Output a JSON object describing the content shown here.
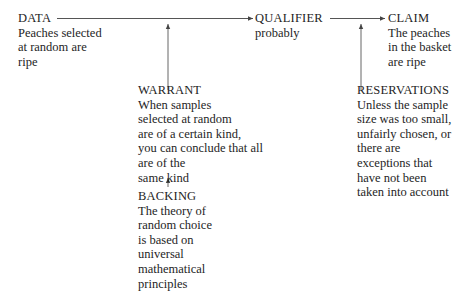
{
  "diagram": {
    "type": "Toulmin argument model",
    "nodes": {
      "data": {
        "title": "DATA",
        "lines": [
          "Peaches selected",
          "at random are",
          "ripe"
        ]
      },
      "qualifier": {
        "title": "QUALIFIER",
        "lines": [
          "probably"
        ]
      },
      "claim": {
        "title": "CLAIM",
        "lines": [
          "The peaches",
          "in the basket",
          "are ripe"
        ]
      },
      "warrant": {
        "title": "WARRANT",
        "lines": [
          "When samples",
          "selected at random",
          "are of a certain kind,",
          "you can conclude that all",
          "are of the",
          "same kind"
        ]
      },
      "backing": {
        "title": "BACKING",
        "lines": [
          "The theory of",
          "random choice",
          "is based on",
          "universal",
          "mathematical",
          "principles"
        ]
      },
      "reservations": {
        "title": "RESERVATIONS",
        "lines": [
          "Unless the sample",
          "size was too small,",
          "unfairly chosen, or",
          "there are",
          "exceptions that",
          "have not been",
          "taken into account"
        ]
      }
    },
    "edges": [
      {
        "from": "DATA",
        "to": "QUALIFIER"
      },
      {
        "from": "QUALIFIER",
        "to": "CLAIM"
      },
      {
        "from": "WARRANT",
        "to": "DATA-QUALIFIER link"
      },
      {
        "from": "BACKING",
        "to": "WARRANT"
      },
      {
        "from": "RESERVATIONS",
        "to": "QUALIFIER-CLAIM link"
      }
    ],
    "colors": {
      "ink": "#1e1e1e",
      "line": "#555555",
      "background": "#ffffff"
    }
  }
}
